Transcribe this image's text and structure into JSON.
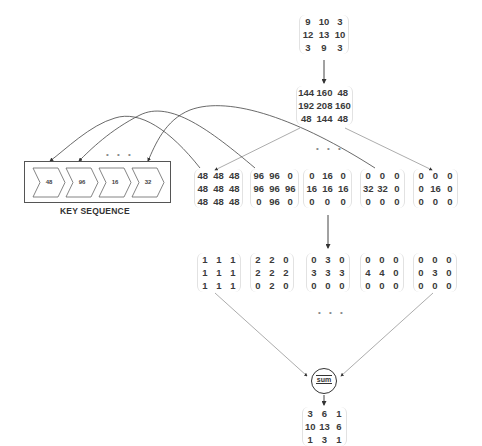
{
  "input_matrix": [
    [
      "9",
      "10",
      "3"
    ],
    [
      "12",
      "13",
      "10"
    ],
    [
      "3",
      "9",
      "3"
    ]
  ],
  "scaled_matrix": [
    [
      "144",
      "160",
      "48"
    ],
    [
      "192",
      "208",
      "160"
    ],
    [
      "48",
      "144",
      "48"
    ]
  ],
  "key_sequence": {
    "label": "KEY SEQUENCE",
    "keys": [
      "48",
      "96",
      "16",
      "32"
    ],
    "ellipsis": "• • •"
  },
  "masked_matrices": [
    [
      [
        "48",
        "48",
        "48"
      ],
      [
        "48",
        "48",
        "48"
      ],
      [
        "48",
        "48",
        "48"
      ]
    ],
    [
      [
        "96",
        "96",
        "0"
      ],
      [
        "96",
        "96",
        "96"
      ],
      [
        "0",
        "96",
        "0"
      ]
    ],
    [
      [
        "0",
        "16",
        "0"
      ],
      [
        "16",
        "16",
        "16"
      ],
      [
        "0",
        "0",
        "0"
      ]
    ],
    [
      [
        "0",
        "0",
        "0"
      ],
      [
        "32",
        "32",
        "0"
      ],
      [
        "0",
        "0",
        "0"
      ]
    ],
    [
      [
        "0",
        "0",
        "0"
      ],
      [
        "0",
        "16",
        "0"
      ],
      [
        "0",
        "0",
        "0"
      ]
    ]
  ],
  "index_matrices": [
    [
      [
        "1",
        "1",
        "1"
      ],
      [
        "1",
        "1",
        "1"
      ],
      [
        "1",
        "1",
        "1"
      ]
    ],
    [
      [
        "2",
        "2",
        "0"
      ],
      [
        "2",
        "2",
        "2"
      ],
      [
        "0",
        "2",
        "0"
      ]
    ],
    [
      [
        "0",
        "3",
        "0"
      ],
      [
        "3",
        "3",
        "3"
      ],
      [
        "0",
        "0",
        "0"
      ]
    ],
    [
      [
        "0",
        "0",
        "0"
      ],
      [
        "4",
        "4",
        "0"
      ],
      [
        "0",
        "0",
        "0"
      ]
    ],
    [
      [
        "0",
        "0",
        "0"
      ],
      [
        "0",
        "3",
        "0"
      ],
      [
        "0",
        "0",
        "0"
      ]
    ]
  ],
  "sum_node": {
    "label": "sum"
  },
  "output_matrix": [
    [
      "3",
      "6",
      "1"
    ],
    [
      "10",
      "13",
      "6"
    ],
    [
      "1",
      "3",
      "1"
    ]
  ],
  "ellipsis": "• • •"
}
